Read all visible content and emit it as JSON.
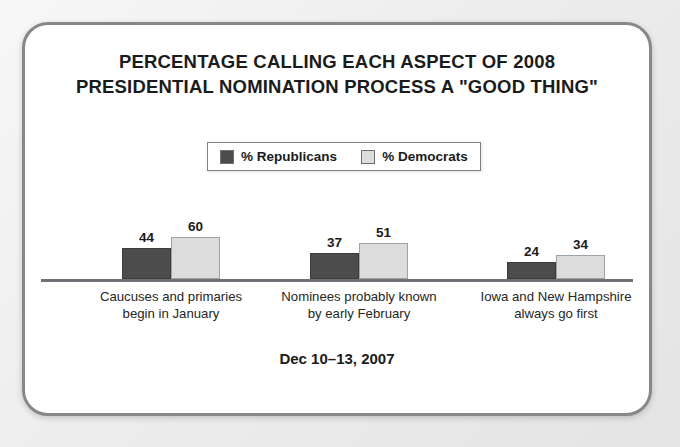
{
  "card": {
    "title_lines": [
      "PERCENTAGE CALLING EACH ASPECT OF 2008",
      "PRESIDENTIAL NOMINATION PROCESS A \"GOOD THING\""
    ],
    "footer": "Dec 10–13, 2007"
  },
  "legend": {
    "entries": [
      {
        "label": "% Republicans",
        "color": "#4c4c4c"
      },
      {
        "label": "% Democrats",
        "color": "#dcdcdc"
      }
    ]
  },
  "chart_data": {
    "type": "bar",
    "title": "PERCENTAGE CALLING EACH ASPECT OF 2008 PRESIDENTIAL NOMINATION PROCESS A \"GOOD THING\"",
    "subtitle": "Dec 10–13, 2007",
    "xlabel": "",
    "ylabel": "",
    "ylim": [
      0,
      100
    ],
    "grid": false,
    "legend_position": "top-center",
    "categories": [
      "Caucuses and primaries begin in January",
      "Nominees probably known by early February",
      "Iowa and New Hampshire always go first"
    ],
    "category_lines": [
      [
        "Caucuses and primaries",
        "begin in January"
      ],
      [
        "Nominees probably known",
        "by early February"
      ],
      [
        "Iowa and New Hampshire",
        "always go first"
      ]
    ],
    "series": [
      {
        "name": "% Republicans",
        "color": "#4c4c4c",
        "values": [
          44,
          37,
          24
        ]
      },
      {
        "name": "% Democrats",
        "color": "#dcdcdc",
        "values": [
          60,
          51,
          34
        ]
      }
    ]
  }
}
